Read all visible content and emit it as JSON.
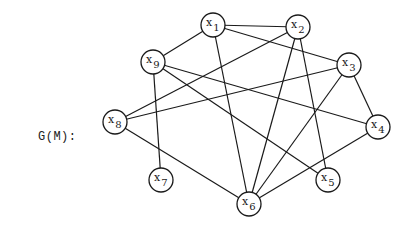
{
  "label": "G(M):",
  "colors": {
    "stroke": "#1a1a1a",
    "background": "#ffffff"
  },
  "nodes": [
    {
      "id": "x1",
      "base": "x",
      "sub": "1",
      "cx": 213,
      "cy": 25
    },
    {
      "id": "x2",
      "base": "x",
      "sub": "2",
      "cx": 298,
      "cy": 27
    },
    {
      "id": "x3",
      "base": "x",
      "sub": "3",
      "cx": 349,
      "cy": 65
    },
    {
      "id": "x4",
      "base": "x",
      "sub": "4",
      "cx": 378,
      "cy": 127
    },
    {
      "id": "x5",
      "base": "x",
      "sub": "5",
      "cx": 328,
      "cy": 180
    },
    {
      "id": "x6",
      "base": "x",
      "sub": "6",
      "cx": 249,
      "cy": 204
    },
    {
      "id": "x7",
      "base": "x",
      "sub": "7",
      "cx": 161,
      "cy": 180
    },
    {
      "id": "x8",
      "base": "x",
      "sub": "8",
      "cx": 115,
      "cy": 122
    },
    {
      "id": "x9",
      "base": "x",
      "sub": "9",
      "cx": 153,
      "cy": 62
    }
  ],
  "edges": [
    [
      "x1",
      "x2"
    ],
    [
      "x1",
      "x9"
    ],
    [
      "x1",
      "x3"
    ],
    [
      "x1",
      "x6"
    ],
    [
      "x2",
      "x8"
    ],
    [
      "x2",
      "x6"
    ],
    [
      "x2",
      "x5"
    ],
    [
      "x3",
      "x8"
    ],
    [
      "x3",
      "x4"
    ],
    [
      "x3",
      "x6"
    ],
    [
      "x9",
      "x7"
    ],
    [
      "x9",
      "x4"
    ],
    [
      "x9",
      "x5"
    ],
    [
      "x8",
      "x6"
    ],
    [
      "x4",
      "x6"
    ]
  ],
  "node_radius": 12
}
